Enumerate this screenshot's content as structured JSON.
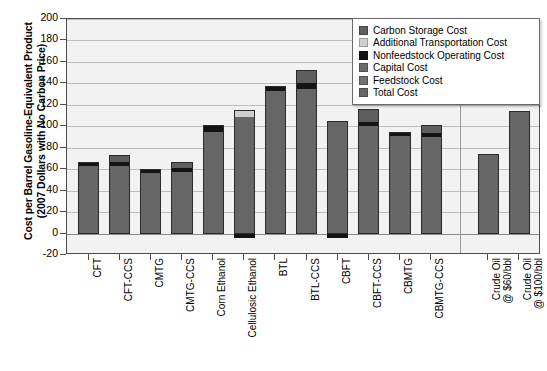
{
  "chart_data": {
    "type": "bar",
    "stacked": true,
    "title": "",
    "xlabel": "",
    "ylabel": "Cost per Barrel Gasoline-Equivalent Product\n(2007 Dollars with No Carbon Price)",
    "ylim": [
      -20,
      200
    ],
    "ytick_values": [
      -20,
      0,
      20,
      40,
      60,
      80,
      100,
      120,
      140,
      160,
      180,
      200
    ],
    "ytick_labels": [
      "-20",
      "0",
      "20",
      "40",
      "60",
      "80",
      "100",
      "120",
      "140",
      "160",
      "180",
      "200"
    ],
    "grid": true,
    "grid_axis": "y",
    "legend_position": "top-right",
    "categories": [
      "CFT",
      "CFT-CCS",
      "CMTG",
      "CMTG-CCS",
      "Corn Ethanol",
      "Cellulosic Ethanol",
      "BTL",
      "BTL-CCS",
      "CBFT",
      "CBFT-CCS",
      "CBMTG",
      "CBMTG-CCS",
      "Crude Oil\n@ $60/bbl",
      "Crude Oil\n@ $100/bbl"
    ],
    "series": [
      {
        "name": "Carbon Storage Cost",
        "color": "#5e5e5e",
        "values": [
          0,
          6,
          0,
          6,
          0,
          0,
          0,
          12,
          0,
          12,
          0,
          7,
          0,
          0
        ]
      },
      {
        "name": "Additional Transportation Cost",
        "color": "#cfcfcf",
        "values": [
          0,
          0,
          0,
          0,
          0,
          6,
          0,
          0,
          0,
          0,
          0,
          0,
          0,
          0
        ]
      },
      {
        "name": "Nonfeedstock Operating Cost",
        "color": "#141414",
        "values": [
          4,
          4,
          4,
          4,
          6,
          -4,
          5,
          5,
          -4,
          4,
          4,
          4,
          0,
          0
        ]
      },
      {
        "name": "Capital Cost",
        "color": "#6b6b6b",
        "values": [
          0,
          0,
          0,
          0,
          0,
          0,
          0,
          0,
          0,
          0,
          0,
          0,
          0,
          0
        ]
      },
      {
        "name": "Feedstock Cost",
        "color": "#707070",
        "values": [
          0,
          0,
          0,
          0,
          0,
          0,
          0,
          0,
          0,
          0,
          0,
          0,
          0,
          0
        ]
      },
      {
        "name": "Total Cost",
        "color": "#666666",
        "values": [
          67,
          73,
          60,
          67,
          101,
          115,
          138,
          152,
          105,
          116,
          95,
          101,
          74,
          114
        ]
      }
    ],
    "bar_totals": [
      67,
      73,
      60,
      67,
      101,
      115,
      138,
      152,
      105,
      116,
      95,
      101,
      74,
      114
    ]
  },
  "legend": {
    "items": [
      {
        "label": "Carbon Storage Cost",
        "color": "#5e5e5e"
      },
      {
        "label": "Additional Transportation Cost",
        "color": "#cfcfcf"
      },
      {
        "label": "Nonfeedstock Operating Cost",
        "color": "#141414"
      },
      {
        "label": "Capital Cost",
        "color": "#6b6b6b"
      },
      {
        "label": "Feedstock Cost",
        "color": "#707070"
      },
      {
        "label": "Total Cost",
        "color": "#666666"
      }
    ]
  }
}
